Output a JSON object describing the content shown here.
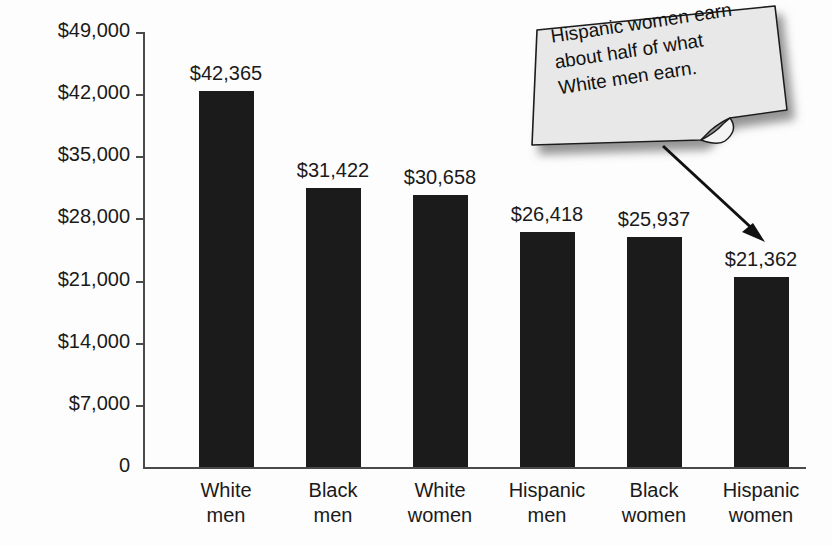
{
  "chart_data": {
    "type": "bar",
    "title": "",
    "xlabel": "",
    "ylabel": "Median income",
    "categories": [
      "White\nmen",
      "Black\nmen",
      "White\nwomen",
      "Hispanic\nmen",
      "Black\nwomen",
      "Hispanic\nwomen"
    ],
    "values": [
      42365,
      31422,
      30658,
      26418,
      25937,
      21362
    ],
    "value_labels": [
      "$42,365",
      "$31,422",
      "$30,658",
      "$26,418",
      "$25,937",
      "$21,362"
    ],
    "ylim": [
      0,
      49000
    ],
    "ytick_values": [
      0,
      7000,
      14000,
      21000,
      28000,
      35000,
      42000,
      49000
    ],
    "ytick_labels": [
      "0",
      "$7,000",
      "$14,000",
      "$21,000",
      "$28,000",
      "$35,000",
      "$42,000",
      "$49,000"
    ],
    "grid": false,
    "legend": null,
    "bar_color": "#1b1b1b",
    "annotations": [
      {
        "name": "callout-note",
        "text": "Hispanic women earn about half of what White men earn.",
        "points_to": "Hispanic women"
      }
    ]
  },
  "callout": {
    "line1": "Hispanic women earn",
    "line2": "about half of what",
    "line3": "White men earn.",
    "fill": "#e8e8e8",
    "stroke": "#1a1a1a"
  },
  "colors": {
    "background": "#fdfdfd",
    "bar": "#1b1b1b",
    "axis": "#4a4a4a",
    "text": "#1a1a1a"
  }
}
